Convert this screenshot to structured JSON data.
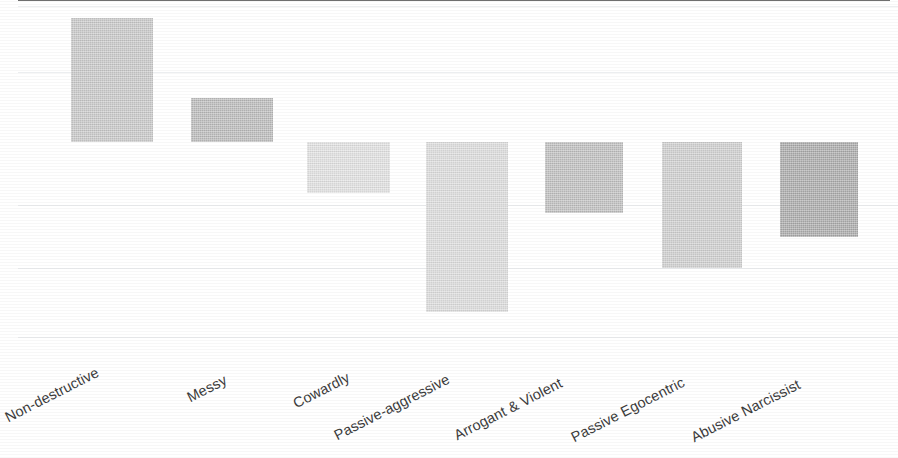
{
  "chart_data": {
    "type": "bar",
    "title": "",
    "subtitle": "",
    "xlabel": "",
    "ylabel": "",
    "grid": true,
    "legend": "none",
    "orientation": "vertical",
    "baseline": 0,
    "ylim": [
      -3.1,
      2.1
    ],
    "y_gridlines": [
      2.06,
      1.06,
      -0.95,
      -1.91,
      -2.95
    ],
    "categories": [
      "Non-destructive",
      "Messy",
      "Cowardly",
      "Passive-aggressive",
      "Arrogant & Violent",
      "Passive Egocentric",
      "Abusive Narcissist"
    ],
    "values": [
      1.88,
      0.67,
      -0.77,
      -2.58,
      -1.08,
      -1.91,
      -1.44
    ],
    "bar_colors": [
      "#c9c9c9",
      "#bcbcbc",
      "#e2e2e2",
      "#dddddd",
      "#c0c0c0",
      "#d0d0d0",
      "#ababab"
    ],
    "axis_color": "#6f6f6f",
    "gridline_color": "#eceef0",
    "label_color": "#3b3b3b",
    "background_color": "#ffffff"
  },
  "geometry": {
    "zero_y": 142,
    "unit_px": 66,
    "plot_left": 18,
    "plot_right": 890,
    "bars": [
      {
        "x": 71,
        "w": 82
      },
      {
        "x": 191,
        "w": 82
      },
      {
        "x": 307,
        "w": 83
      },
      {
        "x": 426,
        "w": 82
      },
      {
        "x": 545,
        "w": 78
      },
      {
        "x": 662,
        "w": 80
      },
      {
        "x": 780,
        "w": 78
      }
    ],
    "label_anchors": [
      {
        "x": 6,
        "y": 60
      },
      {
        "x": 188,
        "y": 40
      },
      {
        "x": 294,
        "y": 46
      },
      {
        "x": 335,
        "y": 78
      },
      {
        "x": 455,
        "y": 78
      },
      {
        "x": 572,
        "y": 80
      },
      {
        "x": 692,
        "y": 80
      }
    ],
    "gridline_y": [
      6,
      72,
      205,
      268,
      337
    ]
  }
}
